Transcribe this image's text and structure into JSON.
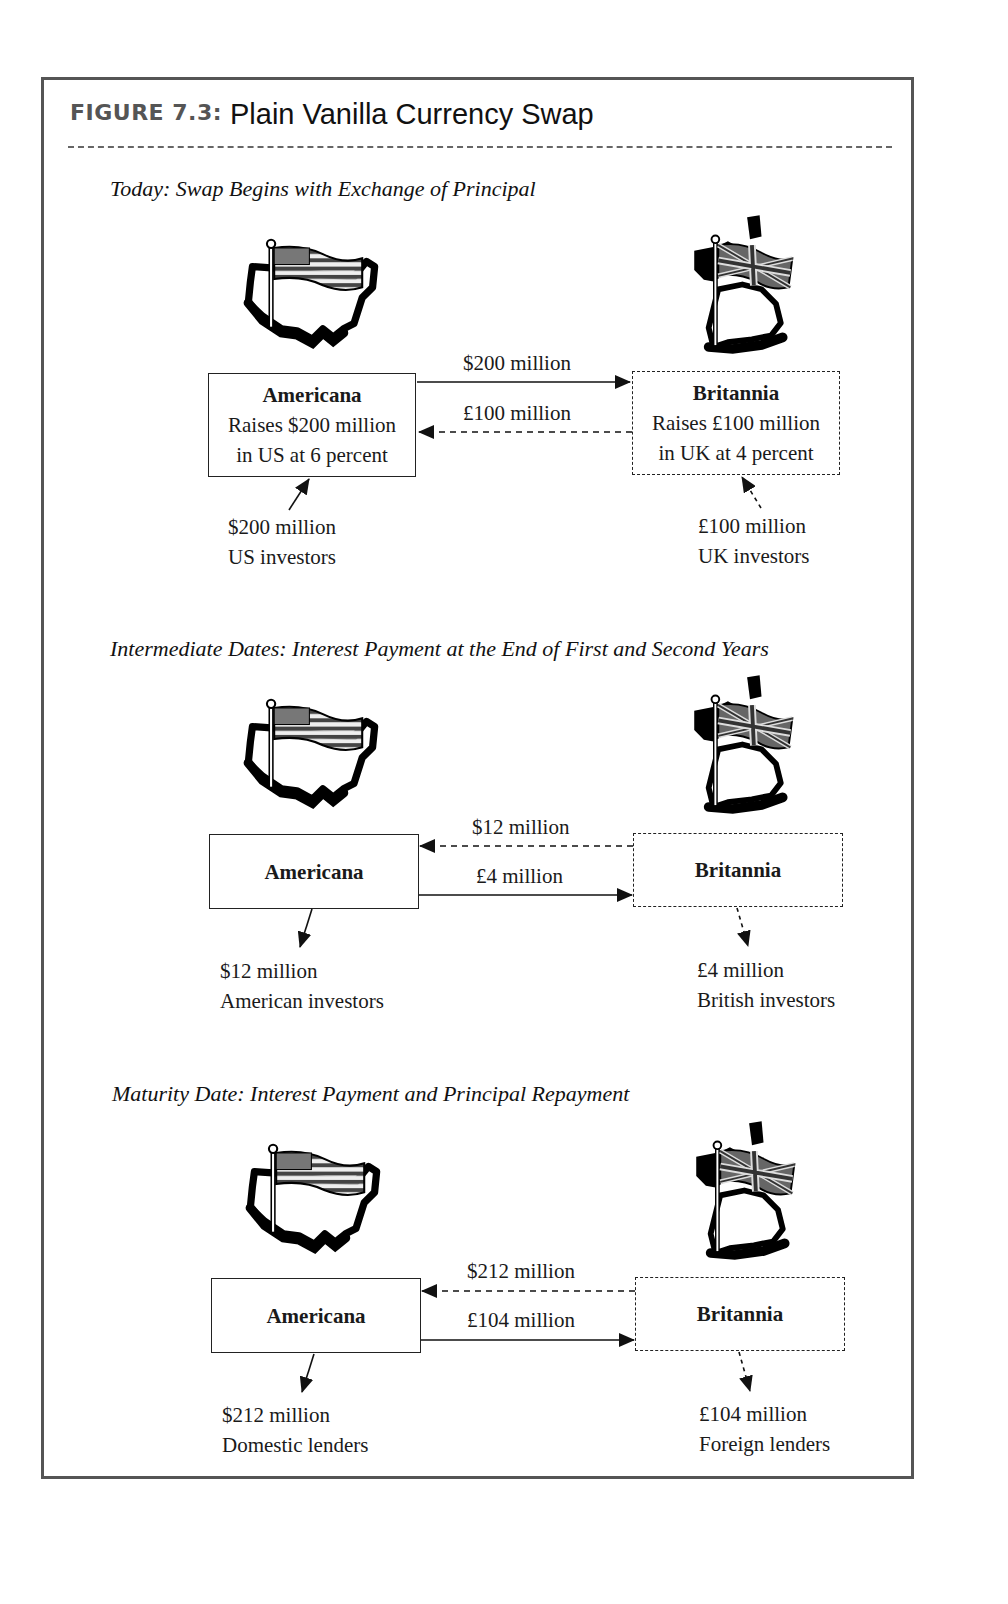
{
  "figure": {
    "label": "FIGURE 7.3:",
    "title": "Plain Vanilla Currency Swap"
  },
  "sections": [
    {
      "title": "Today: Swap Begins with Exchange of Principal",
      "americana": {
        "name": "Americana",
        "line1": "Raises $200 million",
        "line2": "in US at 6 percent"
      },
      "britannia": {
        "name": "Britannia",
        "line1": "Raises £100 million",
        "line2": "in UK at 4 percent"
      },
      "top_flow": {
        "label": "$200 million",
        "direction": "americana-to-britannia",
        "style": "solid"
      },
      "bottom_flow": {
        "label": "£100 million",
        "direction": "britannia-to-americana",
        "style": "dashed"
      },
      "left_party": {
        "amount": "$200 million",
        "name": "US investors",
        "direction": "to-americana"
      },
      "right_party": {
        "amount": "£100 million",
        "name": "UK investors",
        "direction": "to-britannia"
      }
    },
    {
      "title": "Intermediate Dates: Interest Payment at the End of First and Second Years",
      "americana": {
        "name": "Americana"
      },
      "britannia": {
        "name": "Britannia"
      },
      "top_flow": {
        "label": "$12 million",
        "direction": "britannia-to-americana",
        "style": "dashed"
      },
      "bottom_flow": {
        "label": "£4 million",
        "direction": "americana-to-britannia",
        "style": "solid"
      },
      "left_party": {
        "amount": "$12 million",
        "name": "American investors",
        "direction": "from-americana"
      },
      "right_party": {
        "amount": "£4 million",
        "name": "British investors",
        "direction": "from-britannia"
      }
    },
    {
      "title": "Maturity Date: Interest Payment and Principal Repayment",
      "americana": {
        "name": "Americana"
      },
      "britannia": {
        "name": "Britannia"
      },
      "top_flow": {
        "label": "$212 million",
        "direction": "britannia-to-americana",
        "style": "dashed"
      },
      "bottom_flow": {
        "label": "£104 million",
        "direction": "americana-to-britannia",
        "style": "solid"
      },
      "left_party": {
        "amount": "$212 million",
        "name": "Domestic lenders",
        "direction": "from-americana"
      },
      "right_party": {
        "amount": "£104 million",
        "name": "Foreign lenders",
        "direction": "from-britannia"
      }
    }
  ],
  "icons": {
    "us": "us-map-flag-icon",
    "uk": "uk-map-flag-icon"
  },
  "colors": {
    "frame": "#555555",
    "ink": "#1a1a1a",
    "label_gray": "#555555"
  }
}
